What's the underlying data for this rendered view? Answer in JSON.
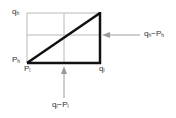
{
  "diagram": {
    "type": "state-transition-sketch",
    "colors": {
      "thick_line": "#111111",
      "grid_line": "#b0b0b0",
      "arrow": "#9a9a9a",
      "text": "#333333"
    },
    "labels": {
      "top_left": {
        "main": "q",
        "sub": "h"
      },
      "bottom_left_upper": {
        "main": "P",
        "sub": "h"
      },
      "bottom_left_lower": {
        "main": "P",
        "sub": "l"
      },
      "bottom_right": {
        "main": "q",
        "sub": "l"
      },
      "right_arrow": {
        "a": "q",
        "a_sub": "h",
        "op": "−",
        "b": "P",
        "b_sub": "h"
      },
      "bottom_arrow": {
        "a": "q",
        "a_sub": "l",
        "op": "−",
        "b": "P",
        "b_sub": "l"
      }
    }
  }
}
